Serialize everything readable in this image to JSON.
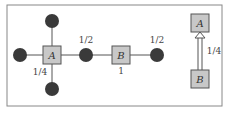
{
  "diagram": {
    "left_graph": {
      "square_nodes": [
        {
          "id": "A",
          "label": "A"
        },
        {
          "id": "B",
          "label": "B",
          "sublabel": "1"
        }
      ],
      "circle_nodes": [
        "top",
        "left",
        "bottom",
        "between-A-B",
        "right-of-B"
      ],
      "labels": {
        "between_label": "1/2",
        "right_label": "1/2",
        "a_label": "1/4",
        "b_label": "1"
      }
    },
    "right_graph": {
      "top_node": "A",
      "bottom_node": "B",
      "edge_label": "1/4",
      "edge_type": "double-line arrow from B to A"
    },
    "colors": {
      "square_fill": "#c8c8c8",
      "square_stroke": "#555555",
      "circle_fill": "#3a3a3a",
      "edge": "#555555",
      "frame": "#777777"
    }
  }
}
